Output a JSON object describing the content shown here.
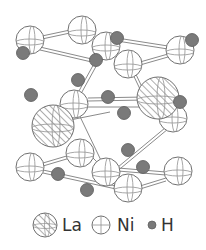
{
  "figure": {
    "type": "crystal-structure",
    "background": "#ffffff",
    "bond_color": "#8a8a8a",
    "atom_outline": "#707070",
    "hydrogen_fill": "#7a7a7a"
  },
  "legend": {
    "items": [
      {
        "symbol": "hatched-sphere",
        "label": "La"
      },
      {
        "symbol": "open-sphere",
        "label": "Ni"
      },
      {
        "symbol": "filled-sphere",
        "label": "H"
      }
    ]
  },
  "atoms": {
    "La": [
      [
        53,
        126
      ],
      [
        158,
        98
      ]
    ],
    "Ni": [
      [
        30,
        40
      ],
      [
        82,
        30
      ],
      [
        106,
        46
      ],
      [
        180,
        50
      ],
      [
        128,
        64
      ],
      [
        74,
        104
      ],
      [
        173,
        118
      ],
      [
        80,
        153
      ],
      [
        30,
        167
      ],
      [
        106,
        172
      ],
      [
        178,
        171
      ],
      [
        128,
        188
      ]
    ],
    "H": [
      [
        23,
        53
      ],
      [
        117,
        38
      ],
      [
        192,
        40
      ],
      [
        96,
        60
      ],
      [
        78,
        80
      ],
      [
        31,
        95
      ],
      [
        108,
        97
      ],
      [
        180,
        102
      ],
      [
        124,
        113
      ],
      [
        128,
        150
      ],
      [
        143,
        167
      ],
      [
        58,
        174
      ],
      [
        87,
        190
      ]
    ]
  }
}
